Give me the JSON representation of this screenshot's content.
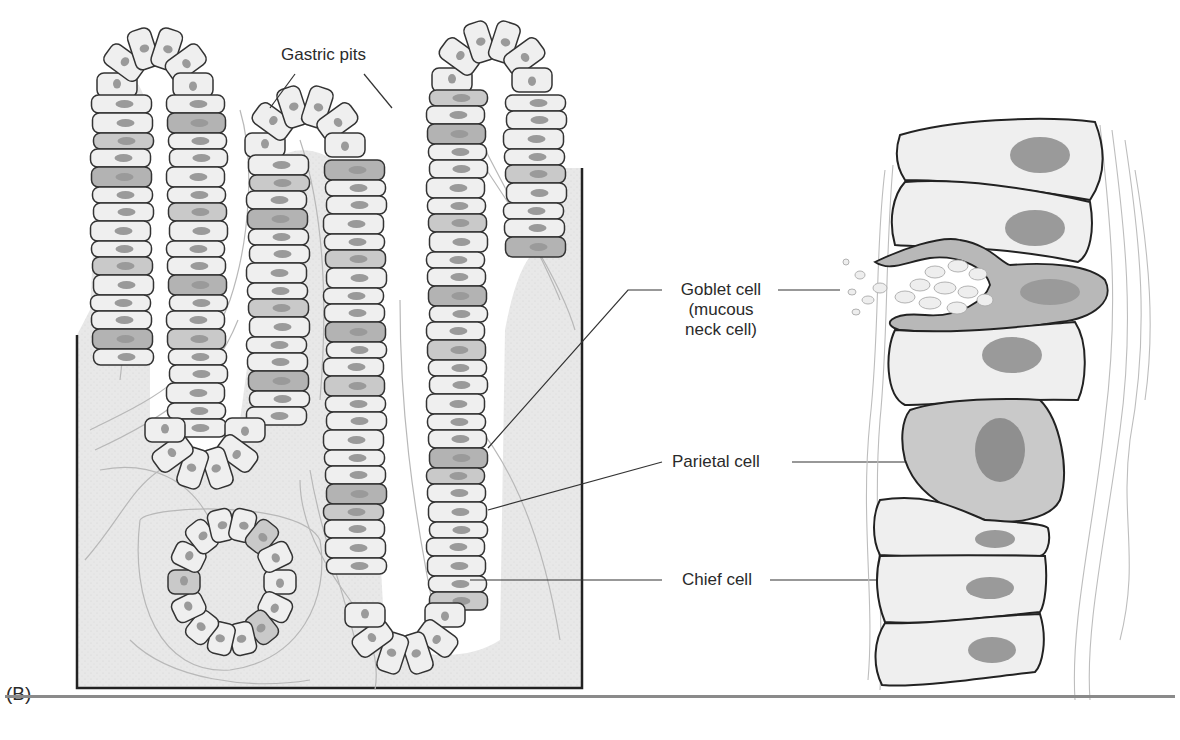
{
  "figure": {
    "panel_letter": "(B)",
    "labels": {
      "gastric_pits": "Gastric pits",
      "goblet_cell_line1": "Goblet cell",
      "goblet_cell_line2": "(mucous",
      "goblet_cell_line3": "neck cell)",
      "parietal_cell": "Parietal cell",
      "chief_cell": "Chief cell"
    },
    "colors": {
      "tissue_fill": "#e6e6e6",
      "cell_fill": "#efefef",
      "parietal_fill": "#c9c9c9",
      "goblet_fill": "#b3b3b3",
      "nucleus": "#9a9a9a",
      "outline": "#333333",
      "fiber": "#b0b0b0",
      "rule": "#8a8a8a"
    }
  }
}
